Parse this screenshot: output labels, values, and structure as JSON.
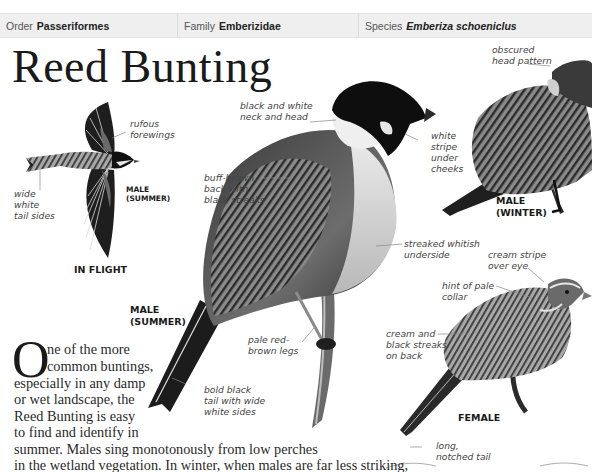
{
  "header": {
    "order_label": "Order",
    "order_value": "Passeriformes",
    "family_label": "Family",
    "family_value": "Emberizidae",
    "species_label": "Species",
    "species_value": "Emberiza schoeniclus"
  },
  "title": "Reed Bunting",
  "in_flight": {
    "caption": "IN FLIGHT",
    "sex_caption": "MALE\n(SUMMER)",
    "labels": {
      "rufous": "rufous\nforewings",
      "tail": "wide\nwhite\ntail sides"
    }
  },
  "male_summer": {
    "caption": "MALE\n(SUMMER)",
    "labels": {
      "neck": "black and white\nneck and head",
      "cheek": "white\nstripe\nunder\ncheeks",
      "back": "buff-brown\nback with\nblack streaks",
      "underside": "streaked whitish\nunderside",
      "legs": "pale red-\nbrown legs",
      "tail": "bold black\ntail with wide\nwhite sides"
    }
  },
  "male_winter": {
    "caption": "MALE\n(WINTER)",
    "labels": {
      "head": "obscured\nhead pattern"
    }
  },
  "female": {
    "caption": "FEMALE",
    "labels": {
      "eye": "cream stripe\nover eye",
      "collar": "hint of pale\ncollar",
      "back": "cream and\nblack streaks\non back",
      "tail": "long,\nnotched tail"
    }
  },
  "intro": {
    "dropcap": "O",
    "line1": "ne of the more",
    "line2": "common buntings,",
    "line3": "especially in any damp",
    "line4": "or wet landscape, the",
    "line5": "Reed Bunting is easy",
    "line6": "to find and identify in",
    "line7": "summer. Males sing monotonously from low perches",
    "line8": "in the wetland vegetation. In winter, when males are far less striking,",
    "line9": "Reed Buntings are not so easily identified and also spread widely"
  }
}
